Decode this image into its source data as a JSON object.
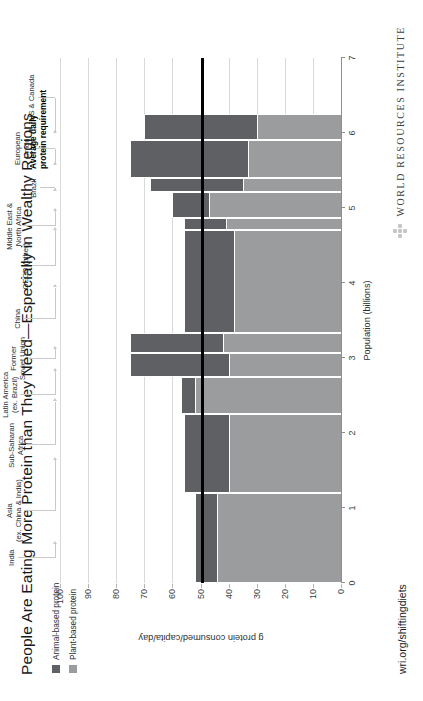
{
  "title": "People Are Eating More Protein than They Need—Especially in Wealthy Regions",
  "legend": {
    "items": [
      {
        "label": "Animal-based protein",
        "color": "#5e6063"
      },
      {
        "label": "Plant-based protein",
        "color": "#9a9c9e"
      }
    ]
  },
  "annotation": {
    "label": "Average daily\nprotein requirement",
    "value": 50,
    "color": "#000000"
  },
  "footer": {
    "url": "wri.org/shiftingdiets",
    "org": "WORLD RESOURCES INSTITUTE",
    "logo_icon": "wri-diamond-icon"
  },
  "chart_data": {
    "type": "bar",
    "subtype": "marimekko-stacked",
    "title": "People Are Eating More Protein than They Need—Especially in Wealthy Regions",
    "xlabel": "Population (billions)",
    "ylabel": "g protein consumed/capita/day",
    "xlim": [
      0,
      7
    ],
    "ylim": [
      0,
      100
    ],
    "xticks": [
      0,
      1,
      2,
      3,
      4,
      5,
      6,
      7
    ],
    "yticks": [
      0,
      10,
      20,
      30,
      40,
      50,
      60,
      70,
      80,
      90,
      100
    ],
    "grid": "horizontal",
    "legend_position": "top-left",
    "categories": [
      "India",
      "Asia\n(ex. China & India)",
      "Sub-Saharan\nAfrica",
      "Latin America\n(ex. Brazil)",
      "Former\nSoviet Union",
      "China",
      "OECD (other)",
      "Middle East &\nNorth Africa",
      "Brazil",
      "European\nUnion",
      "US & Canada"
    ],
    "series": [
      {
        "name": "Plant-based protein",
        "color": "#9a9c9e",
        "values": [
          44,
          40,
          52,
          40,
          42,
          38,
          41,
          47,
          35,
          33,
          30
        ]
      },
      {
        "name": "Animal-based protein",
        "color": "#5e6063",
        "values": [
          8,
          16,
          5,
          35,
          33,
          18,
          15,
          13,
          33,
          42,
          40
        ]
      }
    ],
    "totals": [
      52,
      56,
      57,
      75,
      75,
      56,
      56,
      60,
      68,
      75,
      70
    ],
    "widths_population_billions": [
      1.2,
      1.05,
      0.5,
      0.31,
      0.27,
      1.38,
      0.16,
      0.34,
      0.19,
      0.5,
      0.35
    ],
    "width_units": "billions of people",
    "x_cumulative": [
      0,
      1.2,
      2.25,
      2.75,
      3.06,
      3.33,
      4.71,
      4.87,
      5.21,
      5.4,
      5.9,
      6.25
    ]
  }
}
